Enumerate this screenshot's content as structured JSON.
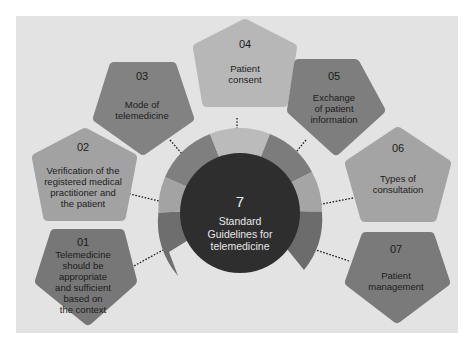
{
  "center": {
    "number": "7",
    "label_lines": [
      "Standard",
      "Guidelines for",
      "telemedicine"
    ]
  },
  "colors": {
    "panel": "#e3e3e3",
    "center_circle": "#2e2e2e",
    "ring_light": "#b8b8b8",
    "ring_mid": "#9c9c9c",
    "ring_dark": "#707070"
  },
  "guidelines": [
    {
      "number": "01",
      "label": "Telemedicine should be appropriate and sufficient based on the context",
      "lines": [
        "Telemedicine",
        "should be",
        "appropriate",
        "and sufficient",
        "based on",
        "the context"
      ],
      "color": "#777777"
    },
    {
      "number": "02",
      "label": "Verification of the registered medical practitioner and the patient",
      "lines": [
        "Verification of the",
        "registered medical",
        "practitioner and",
        "the patient"
      ],
      "color": "#a2a2a2"
    },
    {
      "number": "03",
      "label": "Mode of telemedicine",
      "lines": [
        "Mode of",
        "telemedicine"
      ],
      "color": "#828282"
    },
    {
      "number": "04",
      "label": "Patient consent",
      "lines": [
        "Patient",
        "consent"
      ],
      "color": "#b7b7b7"
    },
    {
      "number": "05",
      "label": "Exchange of patient information",
      "lines": [
        "Exchange",
        "of patient",
        "information"
      ],
      "color": "#7e7e7e"
    },
    {
      "number": "06",
      "label": "Types of consultation",
      "lines": [
        "Types of",
        "consultation"
      ],
      "color": "#a4a4a4"
    },
    {
      "number": "07",
      "label": "Patient management",
      "lines": [
        "Patient",
        "management"
      ],
      "color": "#7a7a7a"
    }
  ]
}
